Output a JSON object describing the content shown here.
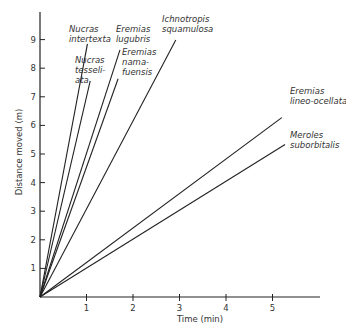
{
  "chart_data": {
    "type": "line",
    "title": "",
    "xlabel": "Time (min)",
    "ylabel": "Distance moved (m)",
    "xlim": [
      0,
      6
    ],
    "ylim": [
      0,
      10
    ],
    "xticks": [
      1,
      2,
      3,
      4,
      5
    ],
    "yticks": [
      1,
      2,
      3,
      4,
      5,
      6,
      7,
      8,
      9
    ],
    "grid": false,
    "legend": "inline labels at line ends",
    "series": [
      {
        "name": "Nucras intertexta",
        "label_lines": [
          "Nucras",
          "intertexta"
        ],
        "x": [
          0,
          1.02
        ],
        "y": [
          0,
          8.85
        ]
      },
      {
        "name": "Nucras tesselata",
        "label_lines": [
          "Nucras",
          "tesseli-",
          "ata"
        ],
        "x": [
          0,
          1.08
        ],
        "y": [
          0,
          7.56
        ]
      },
      {
        "name": "Eremias lugubris",
        "label_lines": [
          "Eremias",
          "lugubris"
        ],
        "x": [
          0,
          1.72
        ],
        "y": [
          0,
          8.64
        ]
      },
      {
        "name": "Eremias namafuensis",
        "label_lines": [
          "Eremias",
          "nama-",
          "fuensis"
        ],
        "x": [
          0,
          1.68
        ],
        "y": [
          0,
          7.63
        ]
      },
      {
        "name": "Ichnotropis squamulosa",
        "label_lines": [
          "Ichnotropis",
          "squamulosa"
        ],
        "x": [
          0,
          2.92
        ],
        "y": [
          0,
          8.99
        ]
      },
      {
        "name": "Eremias lineo-ocellata",
        "label_lines": [
          "Eremias",
          "lineo-ocellata"
        ],
        "x": [
          0,
          5.2
        ],
        "y": [
          0,
          6.27
        ]
      },
      {
        "name": "Meroles suborbitalis",
        "label_lines": [
          "Meroles",
          "suborbitalis"
        ],
        "x": [
          0,
          5.27
        ],
        "y": [
          0,
          5.33
        ]
      }
    ]
  },
  "layout": {
    "origin_px": [
      40,
      297
    ],
    "px_per_x": 46.5,
    "px_per_y": 28.6,
    "x_axis_end_px": 320,
    "y_axis_top_px": 12,
    "label_positions": [
      {
        "x": 69,
        "y": 32
      },
      {
        "x": 75,
        "y": 63
      },
      {
        "x": 116,
        "y": 32
      },
      {
        "x": 122,
        "y": 55
      },
      {
        "x": 162,
        "y": 22
      },
      {
        "x": 290,
        "y": 94
      },
      {
        "x": 290,
        "y": 138
      }
    ],
    "label_line_height": 10,
    "line_color": "#222222",
    "text_color": "#333333"
  }
}
